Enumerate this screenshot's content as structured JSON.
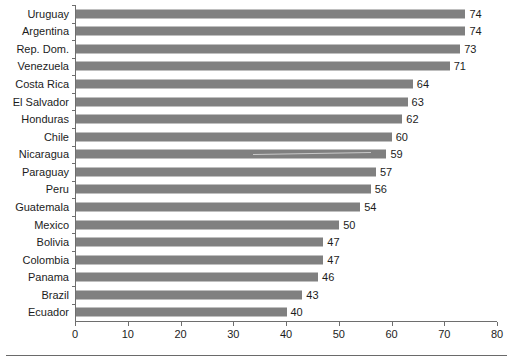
{
  "chart_data": {
    "type": "bar",
    "orientation": "horizontal",
    "title": "",
    "subtitle": "",
    "xlabel": "",
    "ylabel": "",
    "xlim": [
      0,
      80
    ],
    "xticks": [
      0,
      10,
      20,
      30,
      40,
      50,
      60,
      70,
      80
    ],
    "grid": false,
    "legend": false,
    "legend_position": "none",
    "bar_color": "#808080",
    "axis_color": "#6e6e6e",
    "text_color": "#1c1c1c",
    "categories": [
      "Uruguay",
      "Argentina",
      "Rep. Dom.",
      "Venezuela",
      "Costa Rica",
      "El Salvador",
      "Honduras",
      "Chile",
      "Nicaragua",
      "Paraguay",
      "Peru",
      "Guatemala",
      "Mexico",
      "Bolivia",
      "Colombia",
      "Panama",
      "Brazil",
      "Ecuador"
    ],
    "values": [
      74,
      74,
      73,
      71,
      64,
      63,
      62,
      60,
      59,
      57,
      56,
      54,
      50,
      47,
      47,
      46,
      43,
      40
    ],
    "value_labels": [
      "74",
      "74",
      "73",
      "71",
      "64",
      "63",
      "62",
      "60",
      "59",
      "57",
      "56",
      "54",
      "50",
      "47",
      "47",
      "46",
      "43",
      "40"
    ],
    "xtick_labels": [
      "0",
      "10",
      "20",
      "30",
      "40",
      "50",
      "60",
      "70",
      "80"
    ]
  }
}
